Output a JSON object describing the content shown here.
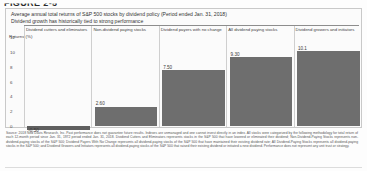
{
  "figure": {
    "number": "FIGURE 2-5"
  },
  "panel": {
    "title_line1": "Average annual total returns of S&P 500 stocks by dividend policy (Period ended Jan. 31, 2018)",
    "title_line2": "Dividend growth has historically tied to strong performance",
    "axis_label": "Returns (%)"
  },
  "chart_data": {
    "type": "bar",
    "title": "Average annual total returns of S&P 500 stocks by dividend policy (Period ended Jan. 31, 2018)",
    "subtitle": "Dividend growth has historically tied to strong performance",
    "xlabel": "",
    "ylabel": "Returns (%)",
    "ylim": [
      -2,
      12
    ],
    "grid": true,
    "legend": "none",
    "categories": [
      "Dividend cutters and eliminators",
      "Non-dividend paying stocks",
      "Dividend payers with no change",
      "All dividend paying stocks",
      "Dividend growers and initiators"
    ],
    "values": [
      -0.5,
      2.6,
      7.5,
      9.3,
      10.1
    ],
    "value_labels": [
      "-0.50",
      "2.60",
      "7.50",
      "9.30",
      "10.1"
    ],
    "yticks": [
      "12",
      "10",
      "8",
      "6",
      "4",
      "2",
      "0"
    ],
    "ytick_values": [
      12,
      10,
      8,
      6,
      4,
      2,
      0
    ]
  },
  "footnote": {
    "text": "Source:  2018 Ned Davis Research, Inc. Past performance does not guarantee future results. Indexes are unmanaged and one cannot invest directly in an index. All stocks were categorized by the following methodology for total return of each 12-month period since Jan. 31, 1972 period ended Jan. 31, 2018. Dividend Cutters and Eliminators represents stocks in the S&P 500 that have lowered or eliminated their dividend; Non-Dividend-Paying Stocks represents non-dividend-paying stocks of the S&P 500; Dividend Payers With No Change represents all dividend-paying stocks of the S&P 500 that have maintained their existing dividend rate; All Dividend-Paying Stocks represents all dividend-paying stocks in the S&P 500; and Dividend Growers and Initiators represents all dividend-paying stocks of the S&P 500 that raised their existing dividend or initiated a new dividend. Performance does not represent any unit trust or strategy."
  }
}
